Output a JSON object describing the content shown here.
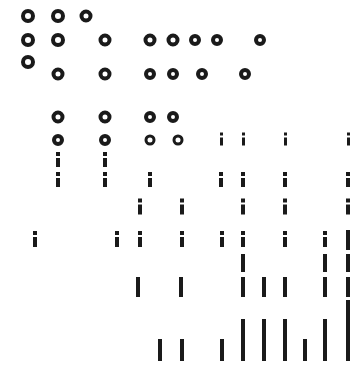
{
  "canvas": {
    "width": 360,
    "height": 368,
    "background": "#ffffff",
    "ink": "#1a1a1a"
  },
  "legend": {
    "ring": "ring-glyph",
    "i": "i-glyph",
    "bar": "bar-glyph"
  },
  "chart_data": {
    "type": "scatter",
    "title": "",
    "subtitle": "",
    "xlabel": "",
    "ylabel": "",
    "grid": false,
    "legend_position": "none",
    "xlim": [
      0,
      360
    ],
    "ylim": [
      0,
      368
    ],
    "marker_kinds": [
      "ring",
      "i",
      "bar"
    ],
    "columns": [
      28,
      58,
      88,
      118,
      148,
      178,
      200,
      222,
      244,
      266,
      288,
      310,
      332,
      350
    ],
    "rows": [
      16,
      40,
      62,
      73,
      100,
      118,
      140,
      158,
      178,
      200,
      218,
      240,
      262,
      285,
      310,
      330,
      350
    ],
    "points": [
      {
        "x": 28,
        "y": 16,
        "kind": "ring",
        "size": 14
      },
      {
        "x": 58,
        "y": 16,
        "kind": "ring",
        "size": 14
      },
      {
        "x": 86,
        "y": 16,
        "kind": "ring",
        "size": 13
      },
      {
        "x": 28,
        "y": 40,
        "kind": "ring",
        "size": 14
      },
      {
        "x": 58,
        "y": 40,
        "kind": "ring",
        "size": 14
      },
      {
        "x": 105,
        "y": 40,
        "kind": "ring",
        "size": 13
      },
      {
        "x": 150,
        "y": 40,
        "kind": "ring",
        "size": 13
      },
      {
        "x": 173,
        "y": 40,
        "kind": "ring",
        "size": 13
      },
      {
        "x": 195,
        "y": 40,
        "kind": "ring",
        "size": 12
      },
      {
        "x": 217,
        "y": 40,
        "kind": "ring",
        "size": 12
      },
      {
        "x": 260,
        "y": 40,
        "kind": "ring",
        "size": 12
      },
      {
        "x": 28,
        "y": 62,
        "kind": "ring",
        "size": 14
      },
      {
        "x": 58,
        "y": 74,
        "kind": "ring",
        "size": 13
      },
      {
        "x": 105,
        "y": 74,
        "kind": "ring",
        "size": 13
      },
      {
        "x": 150,
        "y": 74,
        "kind": "ring",
        "size": 12
      },
      {
        "x": 173,
        "y": 74,
        "kind": "ring",
        "size": 12
      },
      {
        "x": 202,
        "y": 74,
        "kind": "ring",
        "size": 12
      },
      {
        "x": 245,
        "y": 74,
        "kind": "ring",
        "size": 12
      },
      {
        "x": 58,
        "y": 117,
        "kind": "ring",
        "size": 13
      },
      {
        "x": 105,
        "y": 117,
        "kind": "ring",
        "size": 13
      },
      {
        "x": 150,
        "y": 117,
        "kind": "ring",
        "size": 12
      },
      {
        "x": 173,
        "y": 117,
        "kind": "ring",
        "size": 12
      },
      {
        "x": 58,
        "y": 140,
        "kind": "ring",
        "size": 12
      },
      {
        "x": 105,
        "y": 140,
        "kind": "ring",
        "size": 12
      },
      {
        "x": 150,
        "y": 140,
        "kind": "ring",
        "size": 11
      },
      {
        "x": 178,
        "y": 140,
        "kind": "ring",
        "size": 11
      },
      {
        "x": 221,
        "y": 140,
        "kind": "i",
        "size": 15
      },
      {
        "x": 243,
        "y": 140,
        "kind": "i",
        "size": 15
      },
      {
        "x": 285,
        "y": 140,
        "kind": "i",
        "size": 15
      },
      {
        "x": 348,
        "y": 140,
        "kind": "i",
        "size": 15
      },
      {
        "x": 58,
        "y": 160,
        "kind": "i",
        "size": 16
      },
      {
        "x": 105,
        "y": 160,
        "kind": "i",
        "size": 16
      },
      {
        "x": 58,
        "y": 180,
        "kind": "i",
        "size": 16
      },
      {
        "x": 105,
        "y": 180,
        "kind": "i",
        "size": 16
      },
      {
        "x": 150,
        "y": 180,
        "kind": "i",
        "size": 16
      },
      {
        "x": 221,
        "y": 180,
        "kind": "i",
        "size": 16
      },
      {
        "x": 243,
        "y": 180,
        "kind": "i",
        "size": 16
      },
      {
        "x": 285,
        "y": 180,
        "kind": "i",
        "size": 16
      },
      {
        "x": 348,
        "y": 180,
        "kind": "i",
        "size": 16
      },
      {
        "x": 140,
        "y": 207,
        "kind": "i",
        "size": 17
      },
      {
        "x": 182,
        "y": 207,
        "kind": "i",
        "size": 17
      },
      {
        "x": 243,
        "y": 207,
        "kind": "i",
        "size": 17
      },
      {
        "x": 285,
        "y": 207,
        "kind": "i",
        "size": 17
      },
      {
        "x": 348,
        "y": 207,
        "kind": "i",
        "size": 17
      },
      {
        "x": 35,
        "y": 240,
        "kind": "i",
        "size": 18
      },
      {
        "x": 117,
        "y": 240,
        "kind": "i",
        "size": 18
      },
      {
        "x": 140,
        "y": 240,
        "kind": "i",
        "size": 18
      },
      {
        "x": 182,
        "y": 240,
        "kind": "i",
        "size": 18
      },
      {
        "x": 222,
        "y": 240,
        "kind": "i",
        "size": 18
      },
      {
        "x": 243,
        "y": 240,
        "kind": "i",
        "size": 18
      },
      {
        "x": 285,
        "y": 240,
        "kind": "i",
        "size": 18
      },
      {
        "x": 325,
        "y": 240,
        "kind": "i",
        "size": 18
      },
      {
        "x": 348,
        "y": 240,
        "kind": "bar",
        "size": 20
      },
      {
        "x": 243,
        "y": 263,
        "kind": "bar",
        "size": 18
      },
      {
        "x": 325,
        "y": 263,
        "kind": "bar",
        "size": 18
      },
      {
        "x": 348,
        "y": 263,
        "kind": "bar",
        "size": 18
      },
      {
        "x": 138,
        "y": 287,
        "kind": "bar",
        "size": 20
      },
      {
        "x": 181,
        "y": 287,
        "kind": "bar",
        "size": 20
      },
      {
        "x": 243,
        "y": 287,
        "kind": "bar",
        "size": 20
      },
      {
        "x": 264,
        "y": 287,
        "kind": "bar",
        "size": 20
      },
      {
        "x": 285,
        "y": 287,
        "kind": "bar",
        "size": 20
      },
      {
        "x": 325,
        "y": 287,
        "kind": "bar",
        "size": 20
      },
      {
        "x": 348,
        "y": 287,
        "kind": "bar",
        "size": 20
      },
      {
        "x": 348,
        "y": 310,
        "kind": "bar",
        "size": 20
      },
      {
        "x": 243,
        "y": 330,
        "kind": "bar",
        "size": 22
      },
      {
        "x": 264,
        "y": 330,
        "kind": "bar",
        "size": 22
      },
      {
        "x": 285,
        "y": 330,
        "kind": "bar",
        "size": 22
      },
      {
        "x": 325,
        "y": 330,
        "kind": "bar",
        "size": 22
      },
      {
        "x": 348,
        "y": 330,
        "kind": "bar",
        "size": 22
      },
      {
        "x": 160,
        "y": 350,
        "kind": "bar",
        "size": 22
      },
      {
        "x": 182,
        "y": 350,
        "kind": "bar",
        "size": 22
      },
      {
        "x": 222,
        "y": 350,
        "kind": "bar",
        "size": 22
      },
      {
        "x": 243,
        "y": 350,
        "kind": "bar",
        "size": 22
      },
      {
        "x": 264,
        "y": 350,
        "kind": "bar",
        "size": 22
      },
      {
        "x": 285,
        "y": 350,
        "kind": "bar",
        "size": 22
      },
      {
        "x": 305,
        "y": 350,
        "kind": "bar",
        "size": 22
      },
      {
        "x": 325,
        "y": 350,
        "kind": "bar",
        "size": 22
      },
      {
        "x": 348,
        "y": 350,
        "kind": "bar",
        "size": 22
      }
    ]
  }
}
